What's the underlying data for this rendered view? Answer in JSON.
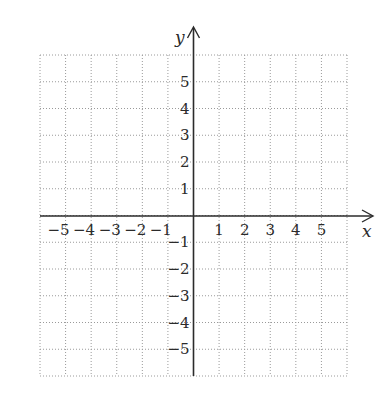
{
  "diagram": {
    "type": "coordinate-plane",
    "x_axis_label": "x",
    "y_axis_label": "y",
    "x_range": [
      -6,
      6
    ],
    "y_range": [
      -6,
      6
    ],
    "grid": "dotted",
    "x_ticks": [
      "−5",
      "−4",
      "−3",
      "−2",
      "−1",
      "1",
      "2",
      "3",
      "4",
      "5"
    ],
    "y_ticks": [
      "5",
      "4",
      "3",
      "2",
      "1",
      "−1",
      "−2",
      "−3",
      "−4",
      "−5"
    ],
    "colors": {
      "axis": "#2b2b2b",
      "grid": "#9a9a9a",
      "background": "#ffffff"
    }
  }
}
